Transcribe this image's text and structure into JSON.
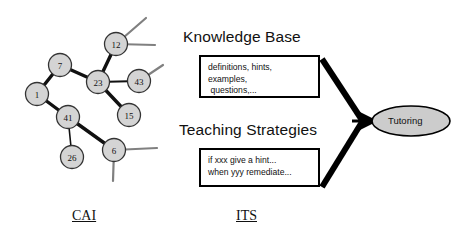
{
  "diagram": {
    "title_left": "CAI",
    "title_right": "ITS",
    "colors": {
      "node_fill": "#d4d4d4",
      "node_stroke": "#333333",
      "edge_dark": "#111111",
      "edge_light": "#808080",
      "box_stroke": "#000000",
      "ellipse_fill": "#cccccc",
      "background": "#ffffff"
    }
  },
  "graph": {
    "name": "cai-tree",
    "nodes": [
      {
        "id": "n12",
        "label": "12",
        "cx": 116,
        "cy": 44,
        "r": 11.5
      },
      {
        "id": "n7",
        "label": "7",
        "cx": 60,
        "cy": 65,
        "r": 11.5
      },
      {
        "id": "n23",
        "label": "23",
        "cx": 98,
        "cy": 82,
        "r": 11.5
      },
      {
        "id": "n43",
        "label": "43",
        "cx": 139,
        "cy": 81,
        "r": 11.5
      },
      {
        "id": "n1",
        "label": "1",
        "cx": 37,
        "cy": 94,
        "r": 11.5
      },
      {
        "id": "n15",
        "label": "15",
        "cx": 129,
        "cy": 115,
        "r": 11.5
      },
      {
        "id": "n41",
        "label": "41",
        "cx": 68,
        "cy": 117,
        "r": 11.5
      },
      {
        "id": "n6",
        "label": "6",
        "cx": 114,
        "cy": 150,
        "r": 11.5
      },
      {
        "id": "n26",
        "label": "26",
        "cx": 72,
        "cy": 157,
        "r": 11.5
      }
    ],
    "edges": [
      {
        "from": "n12",
        "to": "n23",
        "weight": "thick"
      },
      {
        "from": "n7",
        "to": "n23",
        "weight": "thick"
      },
      {
        "from": "n7",
        "to": "n1",
        "weight": "thick"
      },
      {
        "from": "n23",
        "to": "n43",
        "weight": "medium"
      },
      {
        "from": "n23",
        "to": "n15",
        "weight": "thick"
      },
      {
        "from": "n1",
        "to": "n41",
        "weight": "thick"
      },
      {
        "from": "n41",
        "to": "n6",
        "weight": "thick"
      },
      {
        "from": "n41",
        "to": "n26",
        "weight": "thin"
      }
    ],
    "stubs": [
      {
        "from": "n12",
        "x2": 146,
        "y2": 18
      },
      {
        "from": "n12",
        "x2": 155,
        "y2": 45
      },
      {
        "from": "n43",
        "x2": 163,
        "y2": 65
      },
      {
        "from": "n6",
        "x2": 157,
        "y2": 148
      },
      {
        "from": "n6",
        "x2": 113,
        "y2": 181
      }
    ]
  },
  "its": {
    "knowledge_base": {
      "heading": "Knowledge Base",
      "box_text": "definitions, hints,\nexamples,\n questions,..."
    },
    "teaching_strategies": {
      "heading": "Teaching Strategies",
      "box_text": "if xxx give a hint...\nwhen yyy remediate..."
    },
    "tutoring": {
      "label": "Tutoring"
    }
  }
}
